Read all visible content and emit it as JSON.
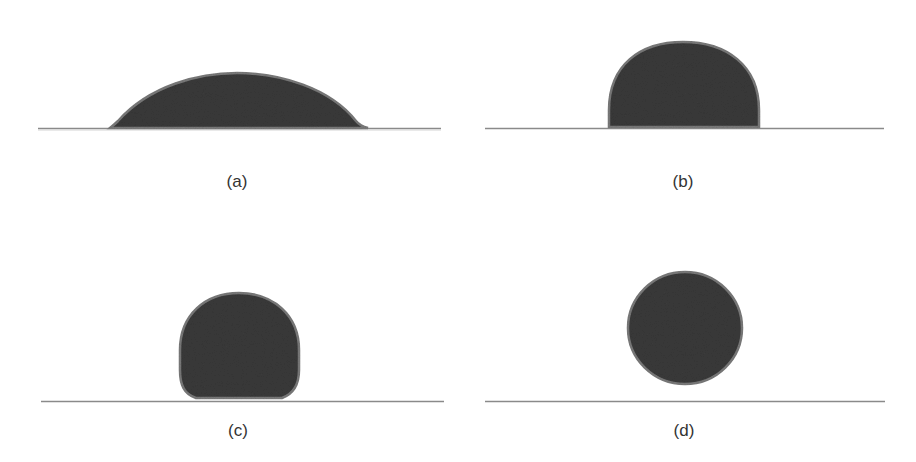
{
  "figure": {
    "panels": [
      {
        "id": "a",
        "label": "(a)",
        "description": "Low-contact-angle spreading droplet (hydrophilic)"
      },
      {
        "id": "b",
        "label": "(b)",
        "description": "Hemispherical droplet (~90 degree contact angle)"
      },
      {
        "id": "c",
        "label": "(c)",
        "description": "High-contact-angle droplet (hydrophobic)"
      },
      {
        "id": "d",
        "label": "(d)",
        "description": "Near-spherical droplet (superhydrophobic)"
      }
    ],
    "colors": {
      "droplet_fill": "#3a3a3a",
      "droplet_edge": "#7a7a7a",
      "baseline": "#8a8a8a",
      "background": "#ffffff",
      "caption": "#333333"
    }
  }
}
